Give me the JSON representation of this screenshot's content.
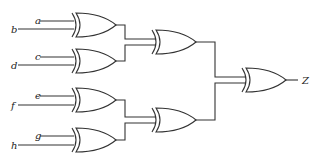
{
  "diagram": {
    "type": "logic-circuit",
    "gate_type": "XOR",
    "inputs": [
      {
        "label": "a",
        "x": 40,
        "y": 21,
        "lx": 35
      },
      {
        "label": "b",
        "x": 18,
        "y": 29,
        "lx": 11
      },
      {
        "label": "c",
        "x": 40,
        "y": 57,
        "lx": 35
      },
      {
        "label": "d",
        "x": 18,
        "y": 65,
        "lx": 11
      },
      {
        "label": "e",
        "x": 40,
        "y": 96,
        "lx": 35
      },
      {
        "label": "f",
        "x": 18,
        "y": 105,
        "lx": 11
      },
      {
        "label": "g",
        "x": 40,
        "y": 136,
        "lx": 35
      },
      {
        "label": "h",
        "x": 18,
        "y": 145,
        "lx": 11
      }
    ],
    "output": {
      "label": "Z"
    },
    "gates": [
      {
        "id": "g1",
        "inputs": [
          "a",
          "b"
        ]
      },
      {
        "id": "g2",
        "inputs": [
          "c",
          "d"
        ]
      },
      {
        "id": "g3",
        "inputs": [
          "g1",
          "g2"
        ]
      },
      {
        "id": "g4",
        "inputs": [
          "e",
          "f"
        ]
      },
      {
        "id": "g5",
        "inputs": [
          "g",
          "h"
        ]
      },
      {
        "id": "g6",
        "inputs": [
          "g4",
          "g5"
        ]
      },
      {
        "id": "g7",
        "inputs": [
          "g3",
          "g6"
        ],
        "output": "Z"
      }
    ]
  }
}
